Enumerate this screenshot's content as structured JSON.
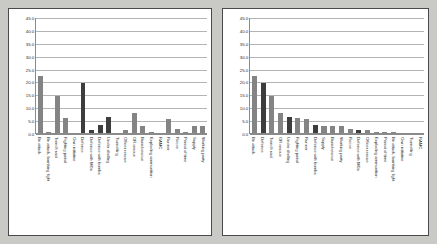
{
  "chart_data": [
    {
      "name": "left-chart",
      "type": "bar",
      "title": "",
      "xlabel": "",
      "ylabel": "",
      "ylim": [
        0.0,
        45.0
      ],
      "ytick_step": 5.0,
      "yticks": [
        "0.0",
        "5.0",
        "10.0",
        "15.0",
        "20.0",
        "25.0",
        "30.0",
        "35.0",
        "40.0",
        "45.0"
      ],
      "grid": true,
      "legend": "none",
      "categories": [
        "Bn attack",
        "Bn attack, bombing fight",
        "Trench raid",
        "Fighting patrol",
        "Own initiative",
        "Defence",
        "Defence with MGs",
        "Defence with bombs",
        "Under shelling",
        "Tunnelling",
        "Officer rescue",
        "OR rescue",
        "Burial rescue",
        "Exploding ammunition",
        "RAMC",
        "Runner",
        "Recce",
        "Period of time",
        "Supply",
        "Working party"
      ],
      "values": [
        22.3,
        0.3,
        14.5,
        5.9,
        0.0,
        19.4,
        1.2,
        3.0,
        6.4,
        0.0,
        1.1,
        7.7,
        2.7,
        0.4,
        0.0,
        5.3,
        1.5,
        0.5,
        2.9,
        2.9
      ],
      "bar_shades": [
        "light",
        "light",
        "light",
        "light",
        "light",
        "dark",
        "dark",
        "dark",
        "dark",
        "light",
        "light",
        "light",
        "light",
        "light",
        "light",
        "light",
        "light",
        "light",
        "light",
        "light"
      ]
    },
    {
      "name": "right-chart",
      "type": "bar",
      "title": "",
      "xlabel": "",
      "ylabel": "",
      "ylim": [
        0.0,
        45.0
      ],
      "ytick_step": 5.0,
      "yticks": [
        "0.0",
        "5.0",
        "10.0",
        "15.0",
        "20.0",
        "25.0",
        "30.0",
        "35.0",
        "40.0",
        "45.0"
      ],
      "grid": true,
      "legend": "none",
      "categories": [
        "Bn attack",
        "Defence",
        "Trench raid",
        "OR rescue",
        "Under shelling",
        "Fighting patrol",
        "Runner",
        "Defence with bombs",
        "Supply",
        "Burial rescue",
        "Working party",
        "Recce",
        "Defence with MGs",
        "Officer rescue",
        "Exploding ammunition",
        "Period of time",
        "Bn attack, bombing fight",
        "Own initiative",
        "Tunnelling",
        "RAMC"
      ],
      "values": [
        22.3,
        19.4,
        14.5,
        7.7,
        6.4,
        5.9,
        5.3,
        3.0,
        2.9,
        2.7,
        2.9,
        1.5,
        1.2,
        1.1,
        0.5,
        0.4,
        0.3,
        0.0,
        0.0,
        0.0
      ],
      "bar_shades": [
        "light",
        "dark",
        "light",
        "light",
        "dark",
        "light",
        "light",
        "dark",
        "light",
        "light",
        "light",
        "light",
        "dark",
        "light",
        "light",
        "light",
        "light",
        "light",
        "light",
        "light"
      ]
    }
  ],
  "colors": {
    "bar_light": "#848484",
    "bar_dark": "#3d3d3d",
    "grid": "#b4b4b4",
    "axis": "#8a8a8a",
    "panel_background": "#ffffff",
    "page_background": "#c9c9c6",
    "panel_border": "#4a4a4a",
    "text": "#1f1f1f"
  }
}
